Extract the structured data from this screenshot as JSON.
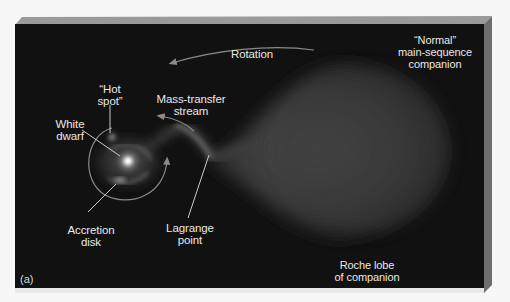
{
  "figure": {
    "panel_label": "(a)",
    "colors": {
      "background": "#f7f7f7",
      "panel_face": "#111111",
      "bevel_top": "#9a9a9a",
      "bevel_side": "#6e6e6e",
      "label_text": "#e8e8e8",
      "arrow": "#8a8a8a"
    }
  },
  "labels": {
    "rotation": "Rotation",
    "companion": "“Normal”\nmain-sequence\ncompanion",
    "hot_spot": "“Hot\nspot”",
    "mass_transfer": "Mass-transfer\nstream",
    "white_dwarf": "White\ndwarf",
    "accretion_disk": "Accretion\ndisk",
    "lagrange_point": "Lagrange\npoint",
    "roche_lobe": "Roche lobe\nof companion"
  }
}
